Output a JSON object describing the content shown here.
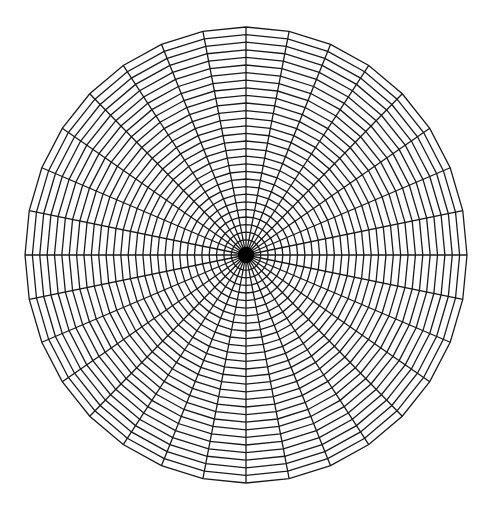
{
  "diagram": {
    "type": "polar-grid",
    "center": {
      "x": 246,
      "y": 255
    },
    "radius_x": 221,
    "radius_y": 228,
    "spoke_count": 32,
    "ring_count": 30,
    "ring_shape": "polygon",
    "line_color": "#1a1a1a",
    "line_width": 1.3,
    "background": "#ffffff",
    "center_dot_radius": 8
  }
}
